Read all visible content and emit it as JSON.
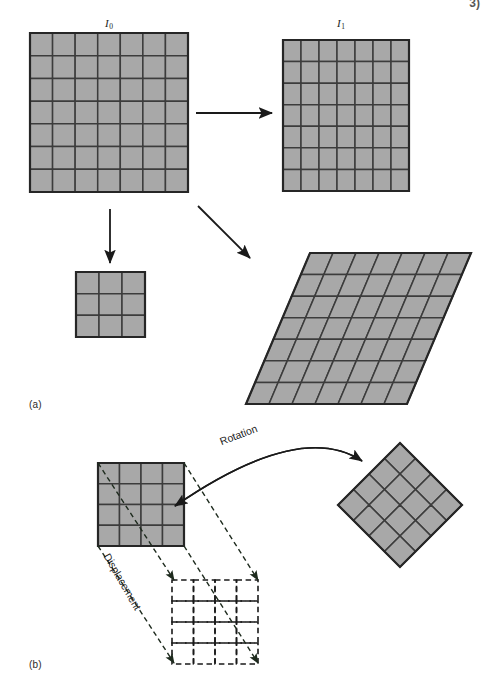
{
  "figure": {
    "caption_a": "(a)",
    "caption_b": "(b)",
    "corner_mark": "3)",
    "labels": {
      "image0_base": "I",
      "image0_sub": "0",
      "image1_base": "I",
      "image1_sub": "1",
      "rotation": "Rotation",
      "displacement": "Displacement"
    },
    "colors": {
      "cell_fill": "#a8a8a8",
      "grid_line": "#3c3c3c",
      "outline": "#262626",
      "arrow": "#1a1a1a",
      "dashed": "#1a1a1a",
      "background": "#ffffff"
    },
    "panel_a": {
      "grids": [
        {
          "name": "source-image-grid",
          "label": "I0",
          "rows": 7,
          "cols": 7,
          "shape": "square",
          "x": 30,
          "y": 33,
          "w": 158,
          "h": 159
        },
        {
          "name": "target-image-grid",
          "label": "I1",
          "rows": 7,
          "cols": 7,
          "shape": "square",
          "x": 283,
          "y": 40,
          "w": 126,
          "h": 151
        },
        {
          "name": "scaled-down-grid",
          "rows": 3,
          "cols": 3,
          "shape": "square",
          "x": 76,
          "y": 272,
          "w": 69,
          "h": 65
        },
        {
          "name": "sheared-grid",
          "rows": 7,
          "cols": 7,
          "shape": "parallelogram",
          "top_left_x": 310,
          "top_y": 253,
          "bottom_left_x": 246,
          "bottom_y": 404,
          "width": 161
        }
      ],
      "arrows": [
        {
          "name": "arrow-identity",
          "from": [
            196,
            113
          ],
          "to": [
            272,
            113
          ]
        },
        {
          "name": "arrow-scale",
          "from": [
            110,
            209
          ],
          "to": [
            110,
            263
          ]
        },
        {
          "name": "arrow-shear",
          "from": [
            198,
            206
          ],
          "to": [
            250,
            258
          ]
        }
      ]
    },
    "panel_b": {
      "grids": [
        {
          "name": "reference-block-grid",
          "rows": 4,
          "cols": 4,
          "shape": "square",
          "x": 98,
          "y": 463,
          "w": 86,
          "h": 83
        },
        {
          "name": "rotated-block-grid",
          "rows": 4,
          "cols": 4,
          "shape": "diamond",
          "cx": 400,
          "cy": 505,
          "half_diagonal": 62,
          "rotation_deg": 45
        },
        {
          "name": "displaced-block-grid",
          "rows": 4,
          "cols": 4,
          "shape": "square-dashed",
          "x": 172,
          "y": 580,
          "w": 86,
          "h": 84
        }
      ],
      "rotation_arc": {
        "name": "rotation-arrow",
        "start": [
          175,
          506
        ],
        "control": [
          300,
          420
        ],
        "end": [
          362,
          461
        ]
      },
      "displacement_arrows": [
        {
          "name": "displacement-arrow-tl",
          "from": [
            98,
            546
          ],
          "to": [
            174,
            663
          ]
        },
        {
          "name": "displacement-arrow-bl",
          "from": [
            98,
            463
          ],
          "to": [
            174,
            580
          ]
        },
        {
          "name": "displacement-arrow-tr",
          "from": [
            184,
            546
          ],
          "to": [
            258,
            663
          ]
        },
        {
          "name": "displacement-arrow-br",
          "from": [
            184,
            463
          ],
          "to": [
            258,
            580
          ]
        }
      ]
    }
  }
}
